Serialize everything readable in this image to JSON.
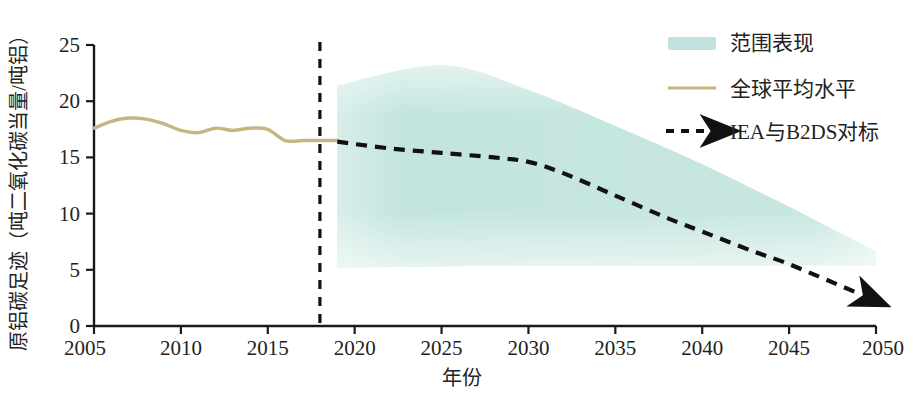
{
  "chart_data": {
    "type": "line",
    "title": "",
    "subtitle": "",
    "xlabel": "年份",
    "ylabel": "原铝碳足迹（吨二氧化碳当量/吨铝）",
    "xlim": [
      2005,
      2050
    ],
    "ylim": [
      0,
      25
    ],
    "grid": false,
    "legend_position": "top-right",
    "x_ticks": [
      "2005",
      "2010",
      "2015",
      "2020",
      "2025",
      "2030",
      "2035",
      "2040",
      "2045",
      "2050"
    ],
    "y_ticks": [
      "0",
      "5",
      "10",
      "15",
      "20",
      "25"
    ],
    "annotations": [
      {
        "name": "divider-year",
        "x": 2018,
        "style": "vertical-dashed"
      }
    ],
    "series": [
      {
        "name": "全球平均水平",
        "type": "line",
        "color": "#c6b583",
        "x": [
          2005,
          2006,
          2007,
          2008,
          2009,
          2010,
          2011,
          2012,
          2013,
          2014,
          2015,
          2016,
          2017,
          2018,
          2019
        ],
        "values": [
          17.6,
          18.2,
          18.5,
          18.4,
          18.0,
          17.4,
          17.2,
          17.6,
          17.4,
          17.6,
          17.5,
          16.5,
          16.5,
          16.5,
          16.5
        ]
      },
      {
        "name": "IEA与B2DS对标",
        "type": "line-dashed-arrow",
        "color": "#111111",
        "x": [
          2019,
          2022,
          2025,
          2028,
          2030,
          2032,
          2035,
          2038,
          2040,
          2043,
          2045,
          2049
        ],
        "values": [
          16.4,
          15.8,
          15.4,
          15.0,
          14.6,
          13.6,
          11.6,
          9.6,
          8.4,
          6.6,
          5.5,
          2.9
        ]
      },
      {
        "name": "范围表现",
        "type": "band",
        "color": "#bfe3dc",
        "x": [
          2019,
          2025,
          2030,
          2035,
          2040,
          2045,
          2050
        ],
        "upper": [
          21.4,
          23.2,
          21.0,
          17.8,
          14.4,
          10.6,
          6.6
        ],
        "lower": [
          5.2,
          5.3,
          5.4,
          5.4,
          5.4,
          5.4,
          5.4
        ]
      }
    ],
    "legend": [
      {
        "label": "范围表现",
        "marker": "band-swatch",
        "color": "#bfe3dc"
      },
      {
        "label": "全球平均水平",
        "marker": "solid-line",
        "color": "#c6b583"
      },
      {
        "label": "IEA与B2DS对标",
        "marker": "dashed-arrow",
        "color": "#111111"
      }
    ]
  }
}
